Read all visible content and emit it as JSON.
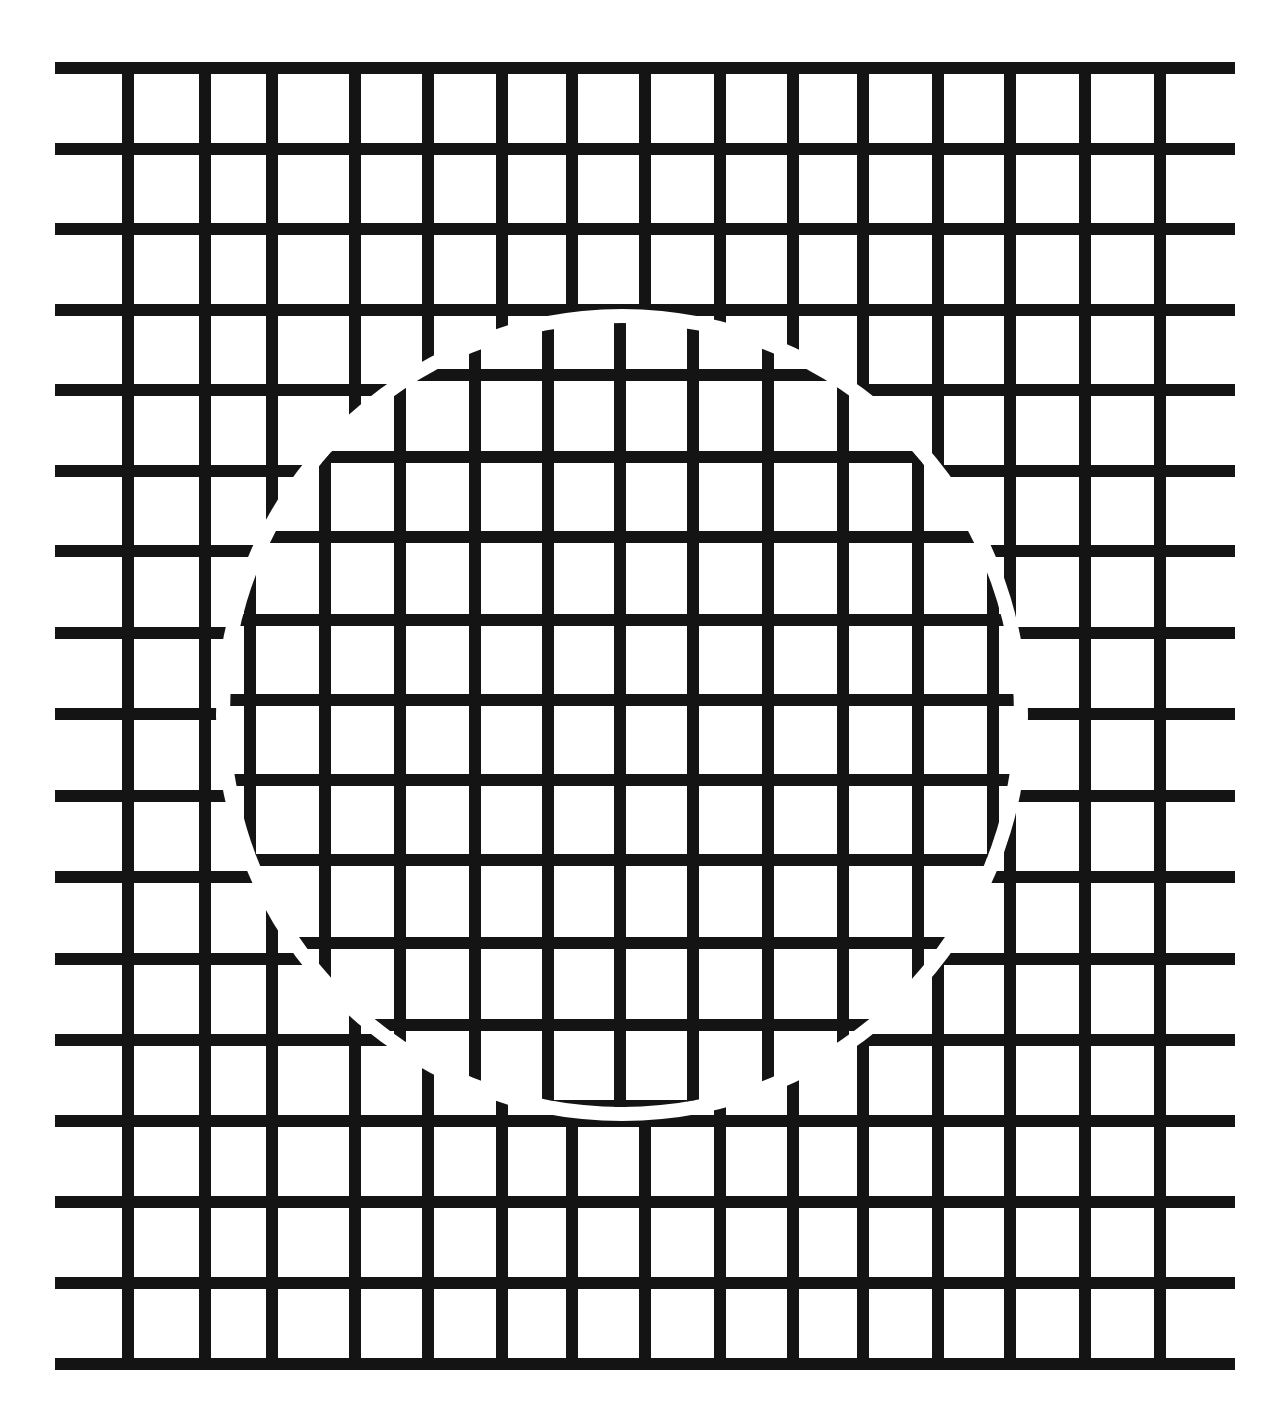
{
  "figure": {
    "colors": {
      "background": "#ffffff",
      "line": "#141414"
    },
    "line_width": 12,
    "outer_grid": {
      "h_lines_y": [
        68,
        149,
        229,
        310,
        390,
        471,
        551,
        633,
        714,
        796,
        877,
        959,
        1040,
        1121,
        1202,
        1283,
        1364
      ],
      "h_x_start": 55,
      "h_x_end": 1235,
      "v_lines_x": [
        128,
        205,
        272,
        355,
        428,
        502,
        572,
        645,
        720,
        793,
        863,
        938,
        1010,
        1085,
        1160
      ],
      "v_y_start": 68,
      "v_y_end": 1364
    },
    "disk": {
      "cx": 622,
      "cy": 715,
      "r": 392,
      "gap": 14
    },
    "inner_grid": {
      "h_lines_y": [
        296,
        375,
        457,
        537,
        620,
        700,
        780,
        860,
        943,
        1025,
        1106
      ],
      "v_lines_x": [
        250,
        325,
        400,
        475,
        548,
        620,
        693,
        768,
        843,
        918,
        993
      ]
    }
  }
}
